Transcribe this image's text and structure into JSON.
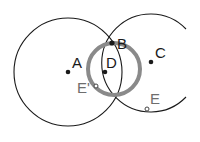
{
  "diagram": {
    "title": "",
    "colors": {
      "stroke": "#1a1a1a",
      "highlight_ring": "#8a8a8a",
      "hollow_label": "#6e6e6e",
      "background": "#ffffff"
    },
    "circles": [
      {
        "id": "circle-A",
        "cx": 68,
        "cy": 72,
        "r": 54,
        "style": "thin-black"
      },
      {
        "id": "circle-C",
        "cx": 151,
        "cy": 63,
        "r": 49,
        "style": "thin-black-arc",
        "gap": "right side"
      },
      {
        "id": "circle-D",
        "cx": 113,
        "cy": 69,
        "r": 26,
        "style": "thick-gray"
      }
    ],
    "points": [
      {
        "label": "A",
        "x": 68,
        "y": 72,
        "type": "solid"
      },
      {
        "label": "B",
        "x": 112,
        "y": 43,
        "type": "solid"
      },
      {
        "label": "C",
        "x": 151,
        "y": 62,
        "type": "solid"
      },
      {
        "label": "D",
        "x": 105,
        "y": 72,
        "type": "solid"
      },
      {
        "label": "E'",
        "x": 96,
        "y": 86,
        "type": "hollow"
      },
      {
        "label": "E",
        "x": 147,
        "y": 109,
        "type": "hollow"
      }
    ]
  }
}
